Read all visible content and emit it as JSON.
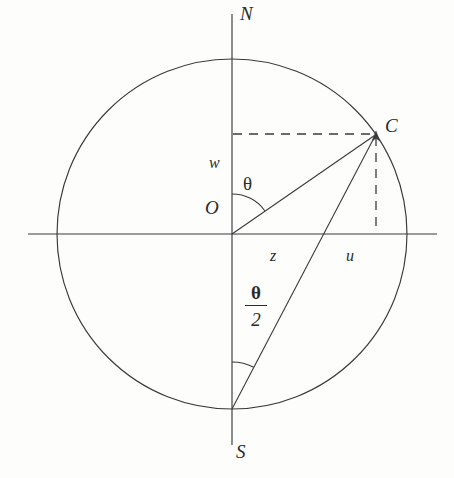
{
  "figure": {
    "background_color": "#fdfdfc",
    "stroke_color": "#3a3a3a",
    "text_color": "#2b2b2b"
  },
  "geometry": {
    "center": {
      "x": 232,
      "y": 234
    },
    "radius": 175,
    "circle_bbox": {
      "left": 57,
      "top": 59,
      "right": 407,
      "bottom": 409
    },
    "point_C": {
      "x": 376,
      "y": 134
    },
    "point_S": {
      "x": 232,
      "y": 409
    },
    "point_N": {
      "x": 232,
      "y": 59
    },
    "vertical_axis": {
      "x": 232,
      "y_top": 14,
      "y_bottom": 445
    },
    "horizontal_axis": {
      "y": 234,
      "x_left": 28,
      "x_right": 437
    },
    "theta_degrees": 55,
    "half_theta_degrees": 27.5,
    "theta_arc_radius": 40,
    "half_theta_arc_radius": 47
  },
  "labels": {
    "north": {
      "text": "N",
      "x": 240,
      "y": 4
    },
    "south": {
      "text": "S",
      "x": 236,
      "y": 442
    },
    "point_c": {
      "text": "C",
      "x": 385,
      "y": 116
    },
    "origin": {
      "text": "O",
      "x": 205,
      "y": 198
    },
    "segment_w": {
      "text": "w",
      "x": 209,
      "y": 155
    },
    "segment_z": {
      "text": "z",
      "x": 270,
      "y": 248
    },
    "segment_u": {
      "text": "u",
      "x": 346,
      "y": 248
    },
    "angle_theta": {
      "text": "θ",
      "x": 243,
      "y": 174
    },
    "angle_half_theta": {
      "numerator": "θ",
      "denominator": "2",
      "x": 245,
      "y": 283
    }
  },
  "lines": {
    "solid": [
      {
        "name": "radius-OC",
        "from": "O",
        "to": "C"
      },
      {
        "name": "chord-SC",
        "from": "S",
        "to": "C"
      }
    ],
    "dashed": [
      {
        "name": "horizontal-projection-to-C",
        "from": "vertical-axis",
        "to": "C"
      },
      {
        "name": "vertical-projection-from-C",
        "from": "C",
        "to": "horizontal-axis"
      }
    ]
  }
}
